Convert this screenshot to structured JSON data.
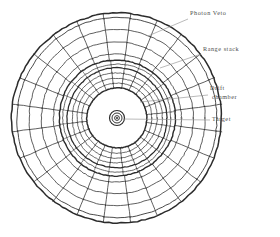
{
  "figure": {
    "type": "detector-cross-section",
    "background": "#ffffff",
    "ink": "#2b2b2b",
    "label_color": "#4d4d4d",
    "center": {
      "x": 117,
      "y": 118
    },
    "outer_radius": 105
  },
  "labels": {
    "photon_veto": "Photon Veto",
    "range_stack": "Range stack",
    "drift_chamber_line1": "Drift",
    "drift_chamber_line2": "chamber",
    "target": "Target"
  },
  "geometry": {
    "sectors": 24,
    "ring_radii": [
      105,
      100,
      88,
      76,
      64,
      58,
      54,
      50,
      45,
      40,
      35,
      30
    ],
    "drift_chamber_radius": 30,
    "target_radii": [
      7.5,
      5.0,
      2.4
    ],
    "photon_veto_band": [
      58,
      105
    ],
    "range_stack_band": [
      30,
      54
    ]
  },
  "leaders": {
    "photon_veto": {
      "x1": 188,
      "y1": 19,
      "x2": 148,
      "y2": 36
    },
    "range_stack": {
      "x1": 201,
      "y1": 54,
      "x2": 160,
      "y2": 68
    },
    "drift_chamber": {
      "x1": 208,
      "y1": 95,
      "x2": 140,
      "y2": 102
    },
    "target": {
      "x1": 210,
      "y1": 120,
      "x2": 123,
      "y2": 119
    }
  }
}
